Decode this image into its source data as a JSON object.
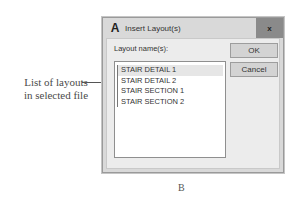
{
  "annotation": {
    "line1": "List of layouts",
    "line2": "in selected file"
  },
  "dialog": {
    "title": "Insert Layout(s)",
    "app_icon": "A",
    "close_glyph": "x",
    "list_label": "Layout name(s):",
    "layouts": [
      {
        "name": "STAIR DETAIL 1",
        "selected": true
      },
      {
        "name": "STAIR DETAIL 2",
        "selected": false
      },
      {
        "name": "STAIR SECTION 1",
        "selected": false
      },
      {
        "name": "STAIR SECTION 2",
        "selected": false
      }
    ],
    "buttons": {
      "ok": "OK",
      "cancel": "Cancel"
    }
  },
  "figure_label": "B"
}
